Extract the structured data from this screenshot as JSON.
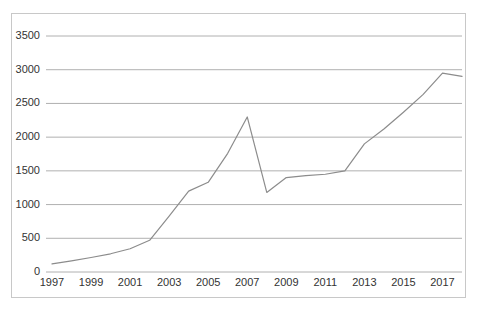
{
  "chart_data": {
    "type": "line",
    "title": "",
    "subtitle": "",
    "xlabel": "",
    "ylabel": "",
    "grid": true,
    "legend": false,
    "legend_position": "none",
    "xlim": [
      1997,
      2018
    ],
    "ylim": [
      0,
      3500
    ],
    "y_ticks": [
      0,
      500,
      1000,
      1500,
      2000,
      2500,
      3000,
      3500
    ],
    "y_tick_labels": [
      "0",
      "500",
      "1000",
      "1500",
      "2000",
      "2500",
      "3000",
      "3500"
    ],
    "x_ticks": [
      1997,
      1999,
      2001,
      2003,
      2005,
      2007,
      2009,
      2011,
      2013,
      2015,
      2017
    ],
    "x_tick_labels": [
      "1997",
      "1999",
      "2001",
      "2003",
      "2005",
      "2007",
      "2009",
      "2011",
      "2013",
      "2015",
      "2017"
    ],
    "x": [
      1997,
      1998,
      1999,
      2000,
      2001,
      2002,
      2003,
      2004,
      2005,
      2006,
      2007,
      2008,
      2009,
      2010,
      2011,
      2012,
      2013,
      2014,
      2015,
      2016,
      2017,
      2018
    ],
    "values": [
      120,
      165,
      215,
      270,
      345,
      470,
      830,
      1200,
      1330,
      1760,
      2300,
      1180,
      1400,
      1430,
      1450,
      1500,
      1900,
      2120,
      2370,
      2630,
      2950,
      2900
    ],
    "series": [
      {
        "name": "series-1",
        "color": "#8c8c8c",
        "values": [
          120,
          165,
          215,
          270,
          345,
          470,
          830,
          1200,
          1330,
          1760,
          2300,
          1180,
          1400,
          1430,
          1450,
          1500,
          1900,
          2120,
          2370,
          2630,
          2950,
          2900
        ]
      }
    ],
    "colors": {
      "line": "#8c8c8c",
      "grid": "#b0b0b0",
      "border": "#c8c8c8",
      "text": "#333333",
      "background": "#ffffff"
    }
  }
}
